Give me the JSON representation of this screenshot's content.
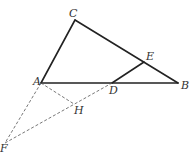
{
  "diagram": {
    "type": "geometry",
    "points": {
      "A": {
        "label": "A",
        "x": 41,
        "y": 83,
        "lx": 33,
        "ly": 85
      },
      "B": {
        "label": "B",
        "x": 178,
        "y": 83,
        "lx": 181,
        "ly": 89
      },
      "C": {
        "label": "C",
        "x": 75,
        "y": 20,
        "lx": 69,
        "ly": 17
      },
      "D": {
        "label": "D",
        "x": 112,
        "y": 83,
        "lx": 109,
        "ly": 94
      },
      "E": {
        "label": "E",
        "x": 144,
        "y": 62,
        "lx": 146,
        "ly": 60
      },
      "F": {
        "label": "F",
        "x": 5,
        "y": 143,
        "lx": 0,
        "ly": 152
      },
      "H": {
        "label": "H",
        "x": 74,
        "y": 104,
        "lx": 74,
        "ly": 114
      }
    },
    "solid_segments": [
      [
        "C",
        "A"
      ],
      [
        "C",
        "B"
      ],
      [
        "A",
        "B"
      ],
      [
        "D",
        "E"
      ]
    ],
    "dashed_segments": [
      [
        "A",
        "F"
      ],
      [
        "A",
        "H"
      ],
      [
        "F",
        "D"
      ]
    ],
    "colors": {
      "solid_line": "#222222",
      "dashed_line": "#555555",
      "label": "#333333",
      "background": "#ffffff"
    }
  }
}
